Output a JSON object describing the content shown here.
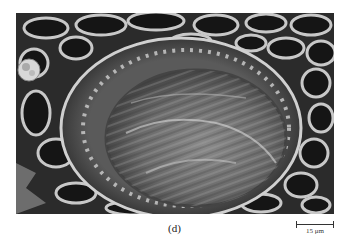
{
  "figure": {
    "panel_label": "(d)",
    "scale_bar": {
      "label": "15 μm"
    }
  }
}
